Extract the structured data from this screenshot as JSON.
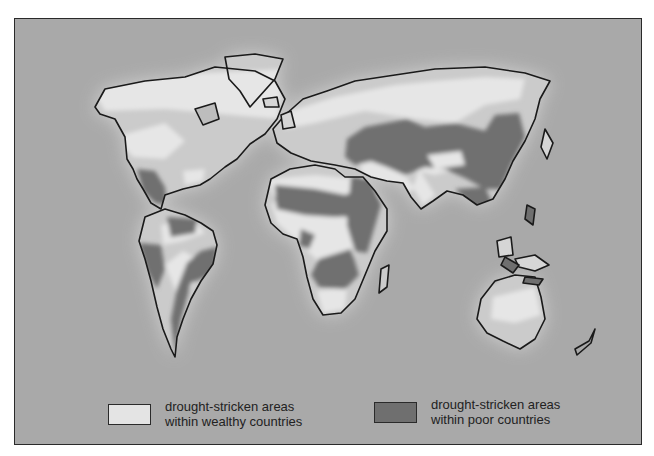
{
  "map": {
    "type": "world-thematic-map",
    "subject": "drought-stricken areas",
    "colors": {
      "ocean": "#a9a9a9",
      "land_glow": "#d4d4d4",
      "land": "#c9c9c9",
      "wealthy": "#e4e4e4",
      "poor": "#6f6f6f",
      "outline": "#1a1a1a"
    },
    "regions": [
      {
        "name": "North America",
        "drought_wealthy": [
          "western United States",
          "central plains"
        ],
        "drought_poor": [
          "Mexico",
          "Central America"
        ]
      },
      {
        "name": "South America",
        "drought_poor": [
          "northern Venezuela/Colombia",
          "Andes west coast",
          "Brazil–Paraguay–Argentina belt"
        ],
        "drought_wealthy": []
      },
      {
        "name": "Europe",
        "drought_wealthy": [
          "Mediterranean Europe"
        ],
        "drought_poor": [
          "Eastern Europe / Ukraine"
        ]
      },
      {
        "name": "Africa",
        "drought_poor": [
          "Sahel",
          "Horn of Africa",
          "southern Africa",
          "Madagascar west"
        ],
        "drought_wealthy": [
          "South Africa"
        ]
      },
      {
        "name": "Asia",
        "drought_poor": [
          "Central Asia",
          "Mongolia",
          "China",
          "Southeast Asia",
          "Indonesia",
          "Philippines"
        ],
        "drought_wealthy": []
      },
      {
        "name": "Oceania",
        "drought_wealthy": [
          "central Australia"
        ],
        "drought_poor": []
      }
    ]
  },
  "legend": {
    "items": [
      {
        "label_line1": "drought-stricken areas",
        "label_line2": "within wealthy countries",
        "color": "#e4e4e4"
      },
      {
        "label_line1": "drought-stricken areas",
        "label_line2": "within poor countries",
        "color": "#6f6f6f"
      }
    ]
  }
}
